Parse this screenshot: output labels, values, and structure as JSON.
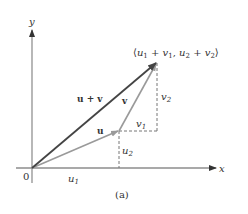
{
  "diagram": {
    "caption": "(a)",
    "origin_label": "0",
    "axes": {
      "x_label": "x",
      "y_label": "y"
    },
    "vectors": {
      "u": {
        "label": "u",
        "color": "#9a9a9a"
      },
      "v": {
        "label": "v",
        "color": "#9a9a9a"
      },
      "sum": {
        "label": "u + v",
        "color": "#555555"
      }
    },
    "components": {
      "u1": "u",
      "u1_sub": "1",
      "u2": "u",
      "u2_sub": "2",
      "v1": "v",
      "v1_sub": "1",
      "v2": "v",
      "v2_sub": "2"
    },
    "endpoint_label": {
      "open": "⟨",
      "u1": "u",
      "s1": "1",
      "plus1": " + ",
      "v1": "v",
      "s2": "1",
      "comma": ", ",
      "u2": "u",
      "s3": "2",
      "plus2": " + ",
      "v2": "v",
      "s4": "2",
      "close": "⟩"
    }
  }
}
